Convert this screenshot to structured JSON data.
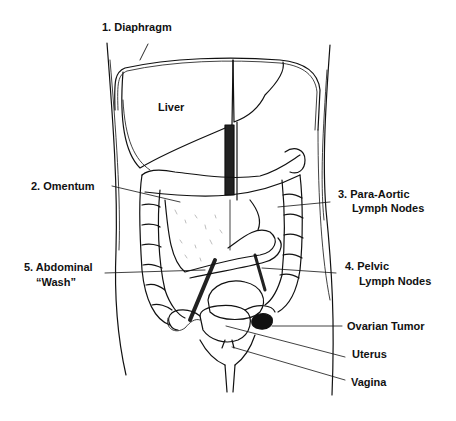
{
  "diagram": {
    "organ_label": "Liver",
    "labels": [
      {
        "id": "diaphragm",
        "text": "1. Diaphragm"
      },
      {
        "id": "omentum",
        "text": "2. Omentum"
      },
      {
        "id": "para_aortic_1",
        "text": "3. Para-Aortic"
      },
      {
        "id": "para_aortic_2",
        "text": "Lymph Nodes"
      },
      {
        "id": "pelvic_1",
        "text": "4. Pelvic"
      },
      {
        "id": "pelvic_2",
        "text": "Lymph Nodes"
      },
      {
        "id": "wash_1",
        "text": "5. Abdominal"
      },
      {
        "id": "wash_2",
        "text": "“Wash”"
      },
      {
        "id": "ovarian_tumor",
        "text": "Ovarian Tumor"
      },
      {
        "id": "uterus",
        "text": "Uterus"
      },
      {
        "id": "vagina",
        "text": "Vagina"
      }
    ],
    "colors": {
      "ink": "#111111",
      "background": "#ffffff"
    }
  }
}
